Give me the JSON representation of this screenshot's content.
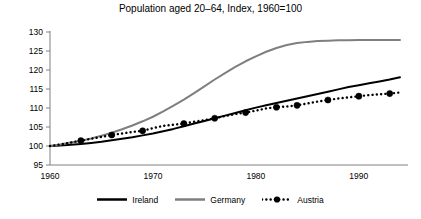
{
  "chart_data": {
    "type": "line",
    "title": "Population aged 20–64, Index, 1960=100",
    "xlabel": "",
    "ylabel": "",
    "xlim": [
      1960,
      1994
    ],
    "ylim": [
      95,
      130
    ],
    "ytick_labels": [
      "130",
      "125",
      "120",
      "115",
      "110",
      "105",
      "100",
      "95"
    ],
    "yticks": [
      130,
      125,
      120,
      115,
      110,
      105,
      100,
      95
    ],
    "xtick_labels": [
      "1960",
      "1970",
      "1980",
      "1990"
    ],
    "xticks": [
      1960,
      1970,
      1980,
      1990
    ],
    "grid": false,
    "legend_position": "bottom",
    "x": [
      1960,
      1961,
      1962,
      1963,
      1964,
      1965,
      1966,
      1967,
      1968,
      1969,
      1970,
      1971,
      1972,
      1973,
      1974,
      1975,
      1976,
      1977,
      1978,
      1979,
      1980,
      1981,
      1982,
      1983,
      1984,
      1985,
      1986,
      1987,
      1988,
      1989,
      1990,
      1991,
      1992,
      1993,
      1994
    ],
    "series": [
      {
        "name": "Ireland",
        "color": "#000000",
        "style": "solid",
        "marker": "none",
        "values": [
          100.0,
          100.1,
          100.3,
          100.5,
          100.8,
          101.1,
          101.5,
          101.9,
          102.3,
          102.8,
          103.3,
          103.9,
          104.5,
          105.2,
          105.9,
          106.6,
          107.3,
          108.0,
          108.7,
          109.4,
          110.1,
          110.7,
          111.3,
          111.9,
          112.5,
          113.1,
          113.7,
          114.3,
          114.9,
          115.5,
          116.0,
          116.5,
          117.0,
          117.5,
          118.1
        ]
      },
      {
        "name": "Germany",
        "color": "#7f7f7f",
        "style": "solid",
        "marker": "none",
        "values": [
          100.0,
          100.4,
          100.9,
          101.4,
          102.0,
          102.7,
          103.5,
          104.4,
          105.4,
          106.5,
          107.7,
          109.1,
          110.6,
          112.2,
          113.9,
          115.7,
          117.5,
          119.2,
          120.8,
          122.3,
          123.6,
          124.8,
          125.8,
          126.6,
          127.1,
          127.4,
          127.6,
          127.7,
          127.8,
          127.8,
          127.9,
          127.9,
          127.9,
          127.9,
          127.9
        ]
      },
      {
        "name": "Austria",
        "color": "#000000",
        "style": "dotted",
        "marker": "circle",
        "marker_years": [
          1963,
          1966,
          1969,
          1973,
          1976,
          1979,
          1982,
          1984,
          1987,
          1990,
          1993
        ],
        "values": [
          100.0,
          100.4,
          100.9,
          101.4,
          101.9,
          102.4,
          102.9,
          103.3,
          103.7,
          104.0,
          104.7,
          105.3,
          105.6,
          105.9,
          106.4,
          106.8,
          107.3,
          107.9,
          108.4,
          108.8,
          109.3,
          109.9,
          110.2,
          110.4,
          110.7,
          111.2,
          111.7,
          112.1,
          112.5,
          112.8,
          113.1,
          113.4,
          113.6,
          113.8,
          114.1
        ]
      }
    ]
  },
  "legend": {
    "items": [
      {
        "label": "Ireland"
      },
      {
        "label": "Germany"
      },
      {
        "label": "Austria"
      }
    ]
  }
}
